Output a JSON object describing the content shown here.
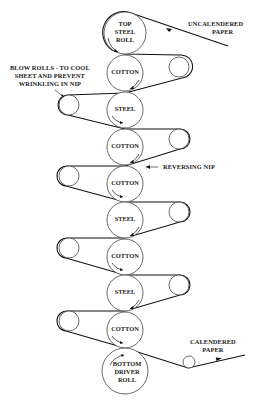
{
  "diagram": {
    "type": "supercalender roll stack",
    "labels": {
      "uncalendered_paper": [
        "UNCALENDERED",
        "PAPER"
      ],
      "blow_rolls": [
        "BLOW ROLLS - TO COOL",
        "SHEET AND PREVENT",
        "WRINKLING IN NIP"
      ],
      "reversing_nip": "REVERSING NIP",
      "calendered_paper": [
        "CALENDERED",
        "PAPER"
      ]
    },
    "rolls": [
      {
        "name": "top-steel-roll",
        "lines": [
          "TOP",
          "STEEL",
          "ROLL"
        ]
      },
      {
        "name": "cotton-roll-1",
        "lines": [
          "COTTON"
        ]
      },
      {
        "name": "steel-roll-1",
        "lines": [
          "STEEL"
        ]
      },
      {
        "name": "cotton-roll-2",
        "lines": [
          "COTTON"
        ]
      },
      {
        "name": "cotton-roll-3",
        "lines": [
          "COTTON"
        ]
      },
      {
        "name": "steel-roll-2",
        "lines": [
          "STEEL"
        ]
      },
      {
        "name": "cotton-roll-4",
        "lines": [
          "COTTON"
        ]
      },
      {
        "name": "steel-roll-3",
        "lines": [
          "STEEL"
        ]
      },
      {
        "name": "cotton-roll-5",
        "lines": [
          "COTTON"
        ]
      },
      {
        "name": "bottom-driver-roll",
        "lines": [
          "BOTTOM",
          "DRIVER",
          "ROLL"
        ]
      }
    ]
  }
}
